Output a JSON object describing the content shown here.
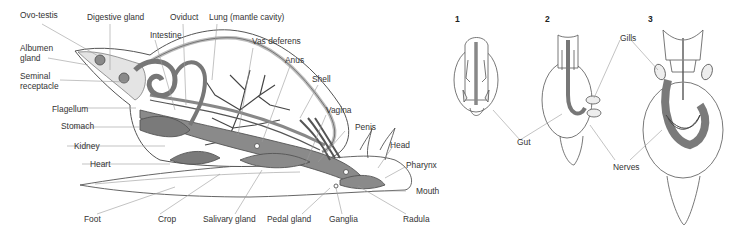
{
  "diagram": {
    "left_figure": {
      "labels": {
        "ovo_testis": "Ovo-testis",
        "digestive_gland": "Digestive gland",
        "oviduct": "Oviduct",
        "lung": "Lung (mantle cavity)",
        "intestine": "Intestine",
        "vas_deferens": "Vas deferens",
        "albumen_gland_1": "Albumen",
        "albumen_gland_2": "gland",
        "anus": "Anus",
        "seminal_receptacle_1": "Seminal",
        "seminal_receptacle_2": "receptacle",
        "shell": "Shell",
        "flagellum": "Flagellum",
        "stomach": "Stomach",
        "vagina": "Vagina",
        "kidney": "Kidney",
        "penis": "Penis",
        "head": "Head",
        "heart": "Heart",
        "pharynx": "Pharynx",
        "mouth": "Mouth",
        "foot": "Foot",
        "crop": "Crop",
        "salivary_gland": "Salivary gland",
        "pedal_gland": "Pedal gland",
        "ganglia": "Ganglia",
        "radula": "Radula"
      }
    },
    "right_figure": {
      "panel_numbers": [
        "1",
        "2",
        "3"
      ],
      "labels": {
        "gills": "Gills",
        "gut": "Gut",
        "nerves": "Nerves"
      }
    },
    "colors": {
      "line": "#555555",
      "organ_fill": "#8a8a8a",
      "organ_dark": "#6e6e6e",
      "stipple": "#d8d8d8",
      "leader": "#9a9a9a"
    }
  }
}
